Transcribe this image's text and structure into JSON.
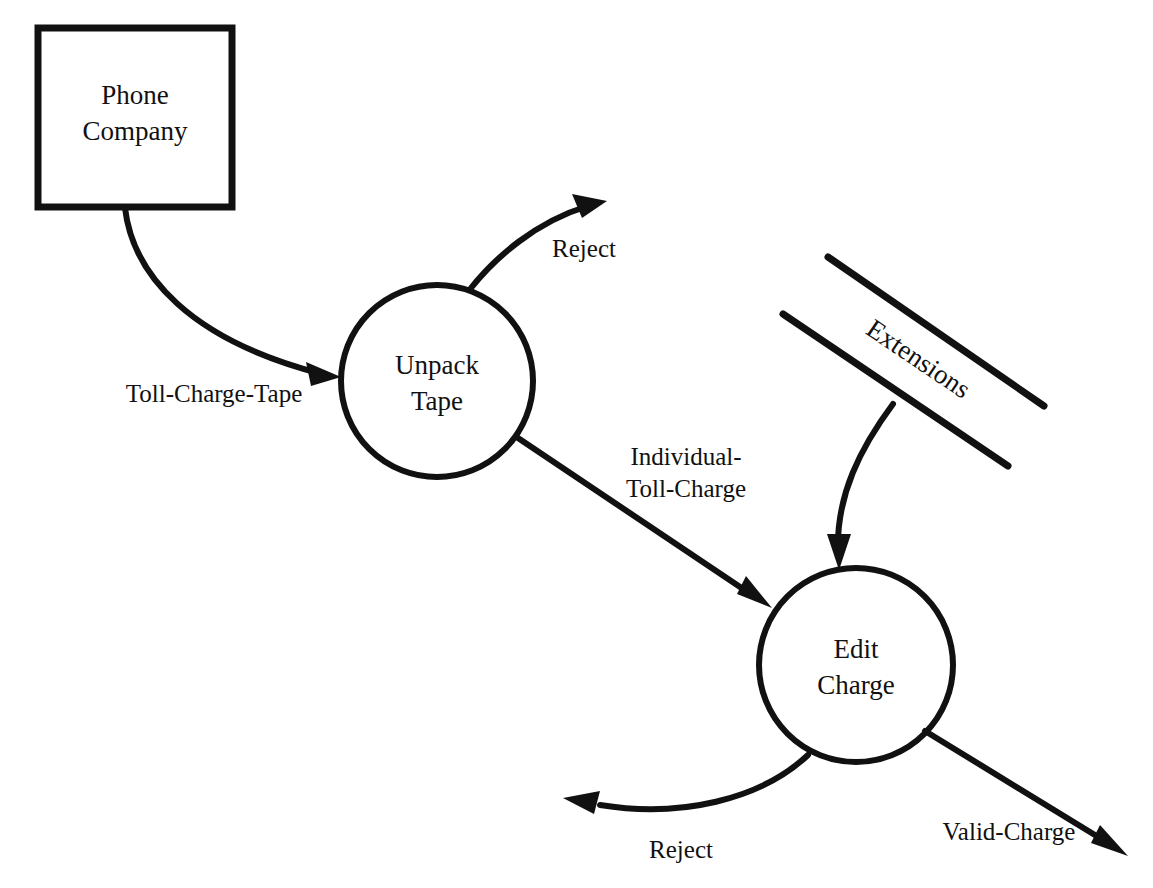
{
  "diagram": {
    "background_color": "#ffffff",
    "ink_color": "#111111",
    "external_entities": [
      {
        "id": "phone-company",
        "label_line_1": "Phone",
        "label_line_2": "Company",
        "shape": "rectangle"
      }
    ],
    "processes": [
      {
        "id": "unpack-tape",
        "label_line_1": "Unpack",
        "label_line_2": "Tape",
        "shape": "circle"
      },
      {
        "id": "edit-charge",
        "label_line_1": "Edit",
        "label_line_2": "Charge",
        "shape": "circle"
      }
    ],
    "data_stores": [
      {
        "id": "extensions",
        "label": "Extensions",
        "shape": "open-rectangle-rotated"
      }
    ],
    "data_flows": [
      {
        "id": "toll-charge-tape",
        "label": "Toll-Charge-Tape",
        "from": "phone-company",
        "to": "unpack-tape",
        "style": "curved"
      },
      {
        "id": "reject-unpack",
        "label": "Reject",
        "from": "unpack-tape",
        "to": "",
        "style": "curved"
      },
      {
        "id": "individual-toll-charge",
        "label_line_1": "Individual-",
        "label_line_2": "Toll-Charge",
        "from": "unpack-tape",
        "to": "edit-charge",
        "style": "straight"
      },
      {
        "id": "extensions-to-edit",
        "label": "",
        "from": "extensions",
        "to": "edit-charge",
        "style": "curved"
      },
      {
        "id": "reject-edit",
        "label": "Reject",
        "from": "edit-charge",
        "to": "",
        "style": "curved"
      },
      {
        "id": "valid-charge",
        "label": "Valid-Charge",
        "from": "edit-charge",
        "to": "",
        "style": "straight"
      }
    ]
  }
}
